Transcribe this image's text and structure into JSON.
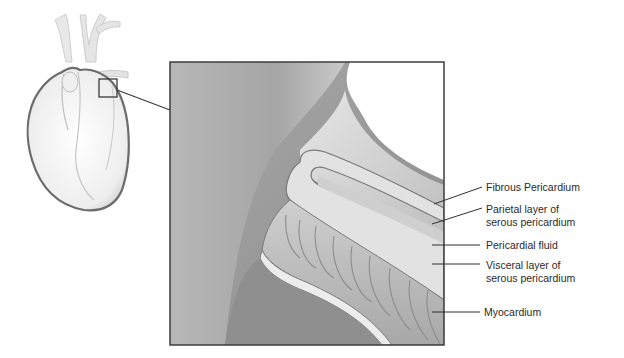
{
  "diagram": {
    "overview": {
      "name": "heart-overview",
      "callout_box": "zoom-region"
    },
    "labels": [
      {
        "id": "fibrous",
        "lines": [
          "Fibrous Pericardium"
        ]
      },
      {
        "id": "parietal",
        "lines": [
          "Parietal layer of",
          "serous pericardium"
        ]
      },
      {
        "id": "fluid",
        "lines": [
          "Pericardial fluid"
        ]
      },
      {
        "id": "visceral",
        "lines": [
          "Visceral layer of",
          "serous pericardium"
        ]
      },
      {
        "id": "myocardium",
        "lines": [
          "Myocardium"
        ]
      }
    ]
  }
}
